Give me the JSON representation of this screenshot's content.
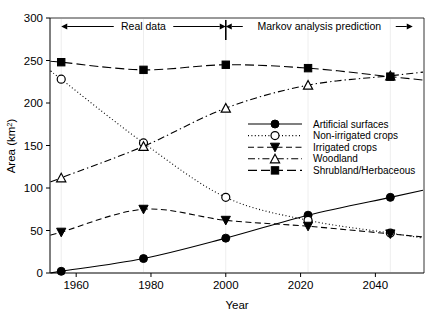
{
  "chart_data": {
    "type": "line",
    "title": "",
    "xlabel": "Year",
    "ylabel": "Area (km2)",
    "ylabel_base": "Area (km",
    "ylabel_sup": "2",
    "ylabel_close": ")",
    "xlim": [
      1953,
      2053
    ],
    "ylim": [
      0,
      300
    ],
    "xticks": [
      1960,
      1980,
      2000,
      2020,
      2040
    ],
    "xtick_labels": [
      "1960",
      "1980",
      "2000",
      "2020",
      "2040"
    ],
    "yticks": [
      0,
      50,
      100,
      150,
      200,
      250,
      300
    ],
    "ytick_labels": [
      "0",
      "50",
      "100",
      "150",
      "200",
      "250",
      "300"
    ],
    "grid": false,
    "legend_position": "center-right",
    "x": [
      1956,
      1978,
      2000,
      2022,
      2044
    ],
    "series": [
      {
        "name": "Artificial surfaces",
        "values": [
          2,
          17,
          41,
          68,
          89
        ],
        "marker": "filled-circle",
        "linestyle": "solid",
        "color": "#000000"
      },
      {
        "name": "Non-irrigated crops",
        "values": [
          228,
          153,
          89,
          62,
          47
        ],
        "marker": "open-circle",
        "linestyle": "dotted",
        "color": "#000000"
      },
      {
        "name": "Irrigated crops",
        "values": [
          48,
          75,
          62,
          55,
          46
        ],
        "marker": "filled-triangle-down",
        "linestyle": "dashed",
        "color": "#000000"
      },
      {
        "name": "Woodland",
        "values": [
          112,
          149,
          194,
          221,
          232
        ],
        "marker": "open-triangle-up",
        "linestyle": "dashdot",
        "color": "#000000"
      },
      {
        "name": "Shrubland/Herbaceous",
        "values": [
          248,
          239,
          245,
          241,
          231
        ],
        "marker": "filled-square",
        "linestyle": "longdash",
        "color": "#000000"
      }
    ],
    "annotations": [
      {
        "text": "Real data",
        "x_start": 1956,
        "x_end": 2000,
        "y": 290
      },
      {
        "text": "Markov analysis prediction",
        "x_start": 2000,
        "x_end": 2050,
        "y": 290
      }
    ],
    "divider_year": 2000
  },
  "legend": {
    "entries": [
      "Artificial surfaces",
      "Non-irrigated crops",
      "Irrigated crops",
      "Woodland",
      "Shrubland/Herbaceous"
    ]
  }
}
